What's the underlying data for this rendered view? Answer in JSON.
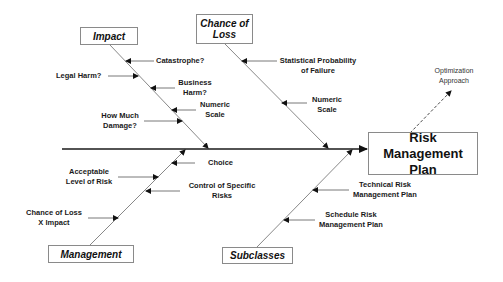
{
  "diagram": {
    "type": "fishbone",
    "effect": {
      "line1": "Risk Management",
      "line2": "Plan"
    },
    "categories": {
      "impact": {
        "label": "Impact",
        "causes": [
          {
            "line1": "Catastrophe?",
            "line2": ""
          },
          {
            "line1": "Legal Harm?",
            "line2": ""
          },
          {
            "line1": "Business",
            "line2": "Harm?"
          },
          {
            "line1": "Numeric",
            "line2": "Scale"
          },
          {
            "line1": "How Much",
            "line2": "Damage?"
          }
        ]
      },
      "chance_of_loss": {
        "label_line1": "Chance of",
        "label_line2": "Loss",
        "causes": [
          {
            "line1": "Statistical Probability",
            "line2": "of Failure"
          },
          {
            "line1": "Numeric",
            "line2": "Scale"
          }
        ]
      },
      "management": {
        "label": "Management",
        "causes": [
          {
            "line1": "Choice",
            "line2": ""
          },
          {
            "line1": "Acceptable",
            "line2": "Level of Risk"
          },
          {
            "line1": "Control of Specific",
            "line2": "Risks"
          },
          {
            "line1": "Chance of Loss",
            "line2": "X Impact"
          }
        ]
      },
      "subclasses": {
        "label": "Subclasses",
        "causes": [
          {
            "line1": "Technical Risk",
            "line2": "Management Plan"
          },
          {
            "line1": "Schedule Risk",
            "line2": "Management Plan"
          }
        ]
      }
    },
    "optimization": {
      "line1": "Optimization",
      "line2": "Approach"
    },
    "colors": {
      "line": "#1a1a1a",
      "bone": "#7a7a7a",
      "box_border": "#8a8a8a"
    }
  }
}
